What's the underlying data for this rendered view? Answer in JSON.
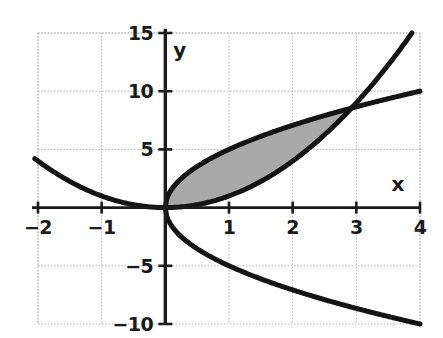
{
  "figure": {
    "kind": "math-plot",
    "background_color": "#ffffff",
    "curve_color": "#141414",
    "grid_color": "#b8b8b8",
    "axis_color": "#1b1b1b",
    "shade_color": "#a9a9a9"
  },
  "axes": {
    "x_label": "x",
    "y_label": "y",
    "x_ticks": [
      {
        "value": -2,
        "label": "−2"
      },
      {
        "value": -1,
        "label": "−1"
      },
      {
        "value": 1,
        "label": "1"
      },
      {
        "value": 2,
        "label": "2"
      },
      {
        "value": 3,
        "label": "3"
      },
      {
        "value": 4,
        "label": "4"
      }
    ],
    "y_ticks": [
      {
        "value": 15,
        "label": "15"
      },
      {
        "value": 10,
        "label": "10"
      },
      {
        "value": 5,
        "label": "5"
      },
      {
        "value": -5,
        "label": "−5"
      },
      {
        "value": -10,
        "label": "−10"
      }
    ]
  },
  "chart_data": {
    "type": "line",
    "title": "",
    "xlabel": "x",
    "ylabel": "y",
    "xlim": [
      -2,
      4
    ],
    "ylim": [
      -10,
      15
    ],
    "grid": true,
    "legend": "none",
    "xticks": [
      -2,
      -1,
      0,
      1,
      2,
      3,
      4
    ],
    "yticks": [
      -10,
      -5,
      0,
      5,
      10,
      15
    ],
    "series": [
      {
        "name": "y = x^2",
        "expression": "y = x*x",
        "color": "#141414",
        "domain": [
          -2.05,
          3.88
        ],
        "points": [
          {
            "x": -2.0,
            "y": 4.0
          },
          {
            "x": -1.5,
            "y": 2.25
          },
          {
            "x": -1.0,
            "y": 1.0
          },
          {
            "x": -0.5,
            "y": 0.25
          },
          {
            "x": 0.0,
            "y": 0.0
          },
          {
            "x": 0.5,
            "y": 0.25
          },
          {
            "x": 1.0,
            "y": 1.0
          },
          {
            "x": 1.5,
            "y": 2.25
          },
          {
            "x": 2.0,
            "y": 4.0
          },
          {
            "x": 2.5,
            "y": 6.25
          },
          {
            "x": 3.0,
            "y": 9.0
          },
          {
            "x": 3.5,
            "y": 12.25
          },
          {
            "x": 3.87,
            "y": 15.0
          }
        ]
      },
      {
        "name": "y = 5*sqrt(x)  (upper branch)",
        "expression": "y = 5*sqrt(x)",
        "color": "#141414",
        "domain": [
          0,
          4
        ],
        "points": [
          {
            "x": 0.0,
            "y": 0.0
          },
          {
            "x": 0.25,
            "y": 2.5
          },
          {
            "x": 0.5,
            "y": 3.54
          },
          {
            "x": 1.0,
            "y": 5.0
          },
          {
            "x": 1.5,
            "y": 6.12
          },
          {
            "x": 2.0,
            "y": 7.07
          },
          {
            "x": 2.5,
            "y": 7.91
          },
          {
            "x": 3.0,
            "y": 8.66
          },
          {
            "x": 3.5,
            "y": 9.35
          },
          {
            "x": 4.0,
            "y": 10.0
          }
        ]
      },
      {
        "name": "y = -5*sqrt(x)  (lower branch)",
        "expression": "y = -5*sqrt(x)",
        "color": "#141414",
        "domain": [
          0,
          4
        ],
        "points": [
          {
            "x": 0.0,
            "y": 0.0
          },
          {
            "x": 0.25,
            "y": -2.5
          },
          {
            "x": 0.5,
            "y": -3.54
          },
          {
            "x": 1.0,
            "y": -5.0
          },
          {
            "x": 1.5,
            "y": -6.12
          },
          {
            "x": 2.0,
            "y": -7.07
          },
          {
            "x": 2.5,
            "y": -7.91
          },
          {
            "x": 3.0,
            "y": -8.66
          },
          {
            "x": 3.5,
            "y": -9.35
          },
          {
            "x": 4.0,
            "y": -10.0
          }
        ]
      }
    ],
    "shaded_region": {
      "label": "region between y = 5*sqrt(x) and y = x^2",
      "color": "#a9a9a9",
      "x_from": 0,
      "x_to": 3,
      "upper": "y = 5*sqrt(x)",
      "lower": "y = x^2"
    },
    "intersections": [
      {
        "x": 0,
        "y": 0
      },
      {
        "x": 3,
        "y": 9
      }
    ]
  }
}
